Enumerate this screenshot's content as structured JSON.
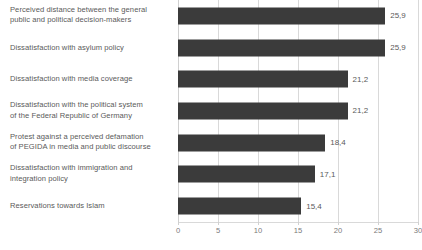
{
  "chart_data": {
    "type": "bar",
    "orientation": "horizontal",
    "title": "",
    "subtitle": "",
    "xlabel": "",
    "ylabel": "",
    "xlim": [
      0,
      30
    ],
    "xticks": [
      0,
      5,
      10,
      15,
      20,
      25,
      30
    ],
    "xtick_labels": [
      "0",
      "5",
      "10",
      "15",
      "20",
      "25",
      "30"
    ],
    "grid": true,
    "grid_axis": "x",
    "legend": false,
    "decimal_separator": ",",
    "bar_color": "#3b3b3b",
    "text_color": "#5a5a5a",
    "gridline_color": "#d9d9d9",
    "categories": [
      "Perceived distance between the general\npublic and political decision-makers",
      "Dissatisfaction with asylum policy",
      "Dissatisfaction with media coverage",
      "Dissatisfaction with the political system\nof the Federal Republic of Germany",
      "Protest against a perceived defamation\nof PEGIDA in media and public discourse",
      "Dissatisfaction with immigration and\nintegration policy",
      "Reservations towards Islam"
    ],
    "values": [
      25.9,
      25.9,
      21.2,
      21.2,
      18.4,
      17.1,
      15.4
    ],
    "value_labels": [
      "25,9",
      "25,9",
      "21,2",
      "21,2",
      "18,4",
      "17,1",
      "15,4"
    ]
  }
}
